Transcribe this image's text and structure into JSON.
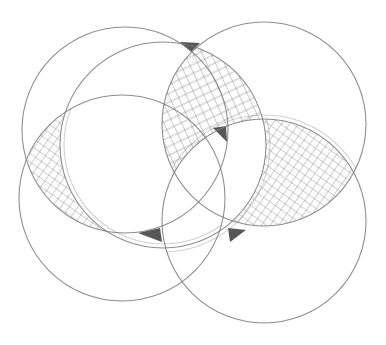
{
  "diagram": {
    "title": "",
    "style": "pencil sketch",
    "colors": {
      "background": "#ffffff",
      "stroke": "#7a7a7a",
      "hatch": "#555555",
      "dark_fill": "#3a3a3a"
    },
    "circles": [
      {
        "id": "top-left",
        "cx": 125,
        "cy": 130,
        "r": 103
      },
      {
        "id": "center",
        "cx": 163,
        "cy": 145,
        "r": 103
      },
      {
        "id": "top-right",
        "cx": 264,
        "cy": 124,
        "r": 102
      },
      {
        "id": "bottom-left",
        "cx": 122,
        "cy": 198,
        "r": 103
      },
      {
        "id": "bottom-right",
        "cx": 264,
        "cy": 221,
        "r": 102
      }
    ],
    "hatched_regions": [
      {
        "id": "left-lens",
        "description": "crosshatched crescent between top-left and bottom-left circles"
      },
      {
        "id": "top-right-lens",
        "description": "crosshatched crescent along upper-left of top-right circle"
      },
      {
        "id": "right-lens",
        "description": "crosshatched crescent between top-right and bottom-right circles"
      }
    ],
    "dark_triangles": [
      {
        "id": "top",
        "x": 190,
        "y": 44
      },
      {
        "id": "middle-right",
        "x": 222,
        "y": 135
      },
      {
        "id": "bottom-center",
        "x": 152,
        "y": 233
      },
      {
        "id": "bottom-right",
        "x": 237,
        "y": 232
      }
    ]
  }
}
